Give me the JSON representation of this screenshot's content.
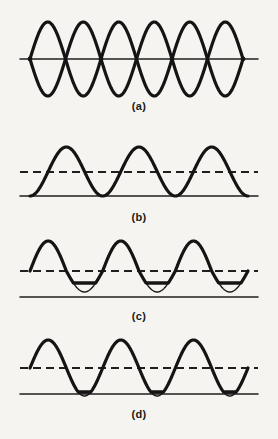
{
  "figure": {
    "background_color": "#f6f4f0",
    "ink_color": "#141414",
    "width": 278,
    "height": 439,
    "panels": [
      {
        "id": "a",
        "label": "(a)",
        "label_y": 100,
        "type": "standing-wave",
        "description": "Standing wave envelope: sine and its mirror image crossing at nodes",
        "axis_y": 59,
        "x_start": 20,
        "x_end": 258,
        "amplitude": 37,
        "cycles": 3,
        "has_dashed_line": false,
        "node_x": [
          30,
          101,
          172,
          243
        ]
      },
      {
        "id": "b",
        "label": "(b)",
        "label_y": 211,
        "type": "intensity-sin-squared",
        "description": "Squared sine intensity humps resting on baseline, dashed mid-level line",
        "baseline_y": 196,
        "peak_y": 147,
        "dashed_y": 172,
        "x_start": 20,
        "x_end": 258,
        "wave_x_start": 30,
        "wave_x_end": 248,
        "cycles": 3,
        "has_dashed_line": true,
        "clipped": false
      },
      {
        "id": "c",
        "label": "(c)",
        "label_y": 310,
        "type": "clipped-wave-high",
        "description": "Sine about dashed bias level, troughs clipped by horizontal bars well above baseline",
        "baseline_y": 297,
        "dashed_y": 271,
        "peak_y": 241,
        "clip_y": 283,
        "trough_y": 292,
        "x_start": 20,
        "x_end": 258,
        "wave_x_start": 30,
        "wave_x_end": 248,
        "cycles": 3,
        "has_dashed_line": true,
        "clipped": true,
        "clip_bars": 2
      },
      {
        "id": "d",
        "label": "(d)",
        "label_y": 408,
        "type": "clipped-wave-baseline",
        "description": "Sine about dashed bias level with troughs just reaching and flattening on the baseline",
        "baseline_y": 394,
        "dashed_y": 368,
        "peak_y": 340,
        "clip_y": 392,
        "trough_y": 396,
        "x_start": 20,
        "x_end": 258,
        "wave_x_start": 30,
        "wave_x_end": 248,
        "cycles": 3,
        "has_dashed_line": true,
        "clipped": true,
        "clip_bars": 2
      }
    ]
  },
  "chart_data": {
    "type": "line",
    "title": "",
    "xlabel": "",
    "ylabel": "",
    "grid": false,
    "legend": "none",
    "panel_count": 4,
    "panel_labels": [
      "(a)",
      "(b)",
      "(c)",
      "(d)"
    ],
    "series": [
      {
        "name": "(a) standing wave upper envelope",
        "function": "A*sin(2*pi*3*t)",
        "amplitude": 37,
        "cycles": 3,
        "baseline": 59,
        "x": [
          20,
          58,
          95,
          130,
          166,
          201,
          237,
          258
        ],
        "values": [
          0,
          37,
          0,
          -37,
          0,
          37,
          0,
          0
        ]
      },
      {
        "name": "(a) standing wave lower envelope",
        "function": "-A*sin(2*pi*3*t)",
        "amplitude": 37,
        "cycles": 3,
        "baseline": 59,
        "x": [
          20,
          58,
          95,
          130,
          166,
          201,
          237,
          258
        ],
        "values": [
          0,
          -37,
          0,
          37,
          0,
          -37,
          0,
          0
        ]
      },
      {
        "name": "(b) intensity sin squared",
        "function": "A*sin^2(2*pi*1.5*t)",
        "amplitude": 49,
        "cycles": 3,
        "baseline": 196,
        "x": [
          30,
          66,
          103,
          139,
          176,
          212,
          248
        ],
        "values": [
          0,
          49,
          0,
          49,
          0,
          49,
          0
        ]
      },
      {
        "name": "(c) clipped sine, high clip level",
        "function": "A*sin(2*pi*1.5*t) + bias, clipped at clip_y",
        "amplitude": 30,
        "cycles": 3,
        "baseline": 297,
        "bias_level": 271,
        "clip_level": 283,
        "x": [
          30,
          66,
          103,
          139,
          176,
          212,
          248
        ],
        "values": [
          26,
          56,
          14,
          56,
          14,
          56,
          26
        ]
      },
      {
        "name": "(d) clipped sine, baseline clip level",
        "function": "A*sin(2*pi*1.5*t) + bias, clipped at baseline",
        "amplitude": 28,
        "cycles": 3,
        "baseline": 394,
        "bias_level": 368,
        "clip_level": 392,
        "x": [
          30,
          66,
          103,
          139,
          176,
          212,
          248
        ],
        "values": [
          26,
          54,
          2,
          54,
          2,
          54,
          26
        ]
      }
    ],
    "annotations": [
      {
        "panel": "(a)",
        "text": "nodes at crossings",
        "x_positions": [
          30,
          101,
          172,
          243
        ]
      },
      {
        "panel": "(b)",
        "text": "dashed reference level",
        "y": 172
      },
      {
        "panel": "(c)",
        "text": "dashed reference level",
        "y": 271
      },
      {
        "panel": "(c)",
        "text": "clipping bar over trough",
        "y": 283
      },
      {
        "panel": "(d)",
        "text": "dashed reference level",
        "y": 368
      },
      {
        "panel": "(d)",
        "text": "trough touches baseline",
        "y": 392
      }
    ]
  }
}
